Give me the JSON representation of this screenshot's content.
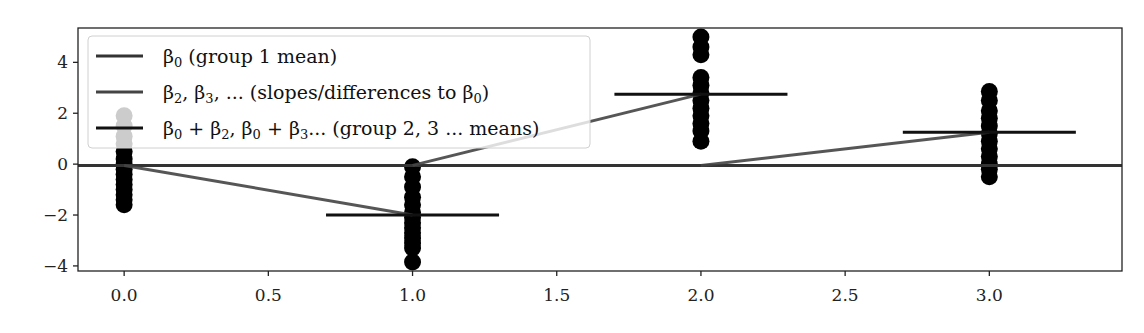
{
  "chart_data": {
    "type": "scatter",
    "title": "",
    "xlabel": "",
    "ylabel": "",
    "xlim": [
      -0.16,
      3.46
    ],
    "ylim": [
      -4.2,
      5.35
    ],
    "xticks": [
      0.0,
      0.5,
      1.0,
      1.5,
      2.0,
      2.5,
      3.0
    ],
    "xtick_labels": [
      "0.0",
      "0.5",
      "1.0",
      "1.5",
      "2.0",
      "2.5",
      "3.0"
    ],
    "yticks": [
      4,
      2,
      0,
      -2,
      -4
    ],
    "ytick_labels": [
      "4",
      "2",
      "0",
      "−2",
      "−4"
    ],
    "grid": false,
    "legend_position": "top-left",
    "groups": [
      {
        "x": 0,
        "points": [
          1.9,
          1.5,
          1.1,
          0.8,
          0.5,
          0.2,
          0.0,
          -0.2,
          -0.4,
          -0.6,
          -0.8,
          -1.0,
          -1.2,
          -1.4,
          -1.6
        ],
        "mean": 0.0
      },
      {
        "x": 1,
        "points": [
          -0.1,
          -0.5,
          -0.9,
          -1.3,
          -1.6,
          -1.9,
          -2.1,
          -2.3,
          -2.5,
          -2.7,
          -2.9,
          -3.1,
          -3.3,
          -3.85
        ],
        "mean": -2.0
      },
      {
        "x": 2,
        "points": [
          5.0,
          4.6,
          4.3,
          3.4,
          3.1,
          2.8,
          2.5,
          2.2,
          1.9,
          1.6,
          1.3,
          0.9
        ],
        "mean": 2.75
      },
      {
        "x": 3,
        "points": [
          2.85,
          2.5,
          2.1,
          1.8,
          1.5,
          1.2,
          0.9,
          0.6,
          0.3,
          0.0,
          -0.2,
          -0.5
        ],
        "mean": 1.25
      }
    ],
    "series": [
      {
        "name": "beta0",
        "label_parts": [
          "β",
          "0",
          " (group 1 mean)"
        ],
        "type": "hline",
        "y": -0.05,
        "color": "#333333"
      },
      {
        "name": "slopes",
        "label_parts": [
          "β",
          "2",
          ", β",
          "3",
          ", ... (slopes/differences to β",
          "0",
          ")"
        ],
        "type": "segments",
        "segments": [
          [
            0,
            -0.05,
            1,
            -2.0
          ],
          [
            1,
            -0.05,
            2,
            2.75
          ],
          [
            2,
            -0.05,
            3,
            1.25
          ]
        ],
        "color": "#444444"
      },
      {
        "name": "group-means",
        "label_parts": [
          "β",
          "0",
          " + β",
          "2",
          ", β",
          "0",
          " + β",
          "3",
          "... (group 2, 3 ... means)"
        ],
        "type": "mean-bars",
        "half_width": 0.3,
        "color": "#111111"
      }
    ],
    "legend": [
      "β0 (group 1 mean)",
      "β2, β3, ... (slopes/differences to β0)",
      "β0 + β2, β0 + β3... (group 2, 3 ... means)"
    ]
  }
}
